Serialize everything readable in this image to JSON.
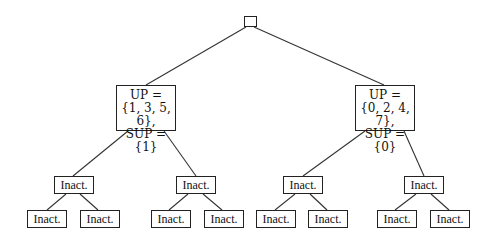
{
  "tree": {
    "root": {
      "label": ""
    },
    "left": {
      "lines": [
        "UP =",
        "{1, 3, 5, 6},",
        "SUP = {1}"
      ],
      "children": [
        {
          "label": "Inact.",
          "children": [
            {
              "label": "Inact."
            },
            {
              "label": "Inact."
            }
          ]
        },
        {
          "label": "Inact.",
          "children": [
            {
              "label": "Inact."
            },
            {
              "label": "Inact."
            }
          ]
        }
      ]
    },
    "right": {
      "lines": [
        "UP =",
        "{0, 2, 4, 7},",
        "SUP = {0}"
      ],
      "children": [
        {
          "label": "Inact.",
          "children": [
            {
              "label": "Inact."
            },
            {
              "label": "Inact."
            }
          ]
        },
        {
          "label": "Inact.",
          "children": [
            {
              "label": "Inact."
            },
            {
              "label": "Inact."
            }
          ]
        }
      ]
    }
  }
}
